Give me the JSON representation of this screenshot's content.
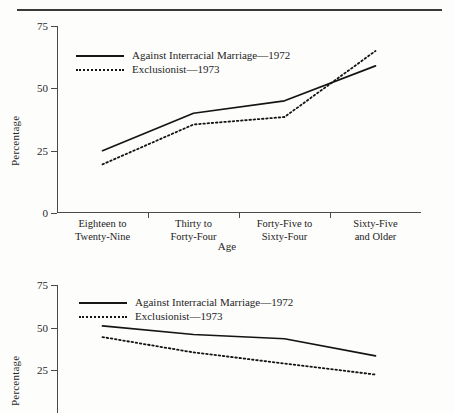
{
  "page": {
    "rule_present": true
  },
  "figures": [
    {
      "id": "figure-top",
      "legend": [
        {
          "label": "Against Interracial Marriage—1972",
          "style": "solid"
        },
        {
          "label": "Exclusionist—1973",
          "style": "dotted"
        }
      ],
      "chart_data": {
        "type": "line",
        "title": "",
        "xlabel": "Age",
        "ylabel": "Percentage",
        "ylim": [
          0,
          75
        ],
        "yticks": [
          0,
          25,
          50,
          75
        ],
        "ytick_labels": [
          "0",
          "25",
          "50",
          "75"
        ],
        "grid": false,
        "legend_position": "top-left inside",
        "categories": [
          "Eighteen to Twenty-Nine",
          "Thirty to Forty-Four",
          "Forty-Five to Sixty-Four",
          "Sixty-Five and Older"
        ],
        "category_lines": [
          [
            "Eighteen to",
            "Twenty-Nine"
          ],
          [
            "Thirty to",
            "Forty-Four"
          ],
          [
            "Forty-Five to",
            "Sixty-Four"
          ],
          [
            "Sixty-Five",
            "and Older"
          ]
        ],
        "series": [
          {
            "name": "Against Interracial Marriage—1972",
            "style": "solid",
            "values": [
              25,
              40,
              45,
              59
            ]
          },
          {
            "name": "Exclusionist—1973",
            "style": "dotted",
            "values": [
              19.5,
              35.5,
              38.5,
              65
            ]
          }
        ]
      }
    },
    {
      "id": "figure-bottom",
      "cropped_at_page_edge": true,
      "legend": [
        {
          "label": "Against Interracial Marriage—1972",
          "style": "solid"
        },
        {
          "label": "Exclusionist—1973",
          "style": "dotted"
        }
      ],
      "chart_data": {
        "type": "line",
        "title": "",
        "xlabel": "",
        "ylabel": "Percentage",
        "ylim": [
          0,
          75
        ],
        "yticks": [
          25,
          50,
          75
        ],
        "ytick_labels": [
          "25",
          "50",
          "75"
        ],
        "grid": false,
        "legend_position": "top-left inside",
        "categories": [
          "",
          "",
          "",
          ""
        ],
        "series": [
          {
            "name": "Against Interracial Marriage—1972",
            "style": "solid",
            "values": [
              51,
              46,
              43.5,
              33.5
            ]
          },
          {
            "name": "Exclusionist—1973",
            "style": "dotted",
            "values": [
              44.5,
              35.5,
              29,
              22.5
            ]
          }
        ]
      }
    }
  ]
}
